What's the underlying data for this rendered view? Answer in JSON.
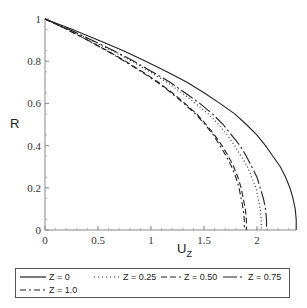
{
  "chart_data": {
    "type": "line",
    "title": "",
    "xlabel": "U",
    "xlabel_sub": "Z",
    "ylabel": "R",
    "xlim": [
      0,
      2.4
    ],
    "ylim": [
      0,
      1
    ],
    "xticks": [
      0,
      0.5,
      1,
      1.5,
      2
    ],
    "xtick_labels": [
      "0",
      "0.5",
      "1",
      "1.5",
      "2"
    ],
    "yticks": [
      0,
      0.2,
      0.4,
      0.6,
      0.8,
      1
    ],
    "ytick_labels": [
      "0",
      "0.2",
      "0.4",
      "0.6",
      "0.8",
      "1"
    ],
    "grid": false,
    "legend_position": "bottom",
    "R": [
      1.0,
      0.95,
      0.9,
      0.85,
      0.8,
      0.75,
      0.7,
      0.65,
      0.6,
      0.55,
      0.5,
      0.45,
      0.4,
      0.35,
      0.3,
      0.25,
      0.2,
      0.15,
      0.1,
      0.05,
      0.0
    ],
    "series": [
      {
        "name": "Z = 0",
        "style": "solid",
        "Umax": 2.37,
        "U": [
          0.0,
          0.26,
          0.5,
          0.74,
          0.95,
          1.15,
          1.34,
          1.5,
          1.65,
          1.79,
          1.9,
          2.0,
          2.08,
          2.15,
          2.22,
          2.27,
          2.31,
          2.34,
          2.36,
          2.37,
          2.37
        ]
      },
      {
        "name": "Z = 0.25",
        "style": "dotted",
        "Umax": 2.04,
        "U": [
          0.0,
          0.23,
          0.43,
          0.63,
          0.82,
          0.99,
          1.15,
          1.29,
          1.42,
          1.54,
          1.64,
          1.72,
          1.79,
          1.85,
          1.91,
          1.95,
          1.99,
          2.01,
          2.03,
          2.04,
          2.04
        ]
      },
      {
        "name": "Z = 0.50",
        "style": "dashed",
        "Umax": 1.9,
        "U": [
          0.0,
          0.21,
          0.4,
          0.59,
          0.76,
          0.92,
          1.07,
          1.2,
          1.32,
          1.43,
          1.52,
          1.6,
          1.67,
          1.73,
          1.78,
          1.82,
          1.85,
          1.87,
          1.89,
          1.9,
          1.9
        ]
      },
      {
        "name": "Z = 0.75",
        "style": "long-dash-dot",
        "Umax": 2.09,
        "U": [
          0.0,
          0.23,
          0.44,
          0.65,
          0.84,
          1.01,
          1.18,
          1.32,
          1.46,
          1.58,
          1.68,
          1.76,
          1.84,
          1.9,
          1.95,
          2.0,
          2.03,
          2.06,
          2.08,
          2.09,
          2.09
        ]
      },
      {
        "name": "Z = 1.0",
        "style": "dash-dot",
        "Umax": 1.88,
        "U": [
          0.0,
          0.21,
          0.4,
          0.58,
          0.75,
          0.91,
          1.06,
          1.19,
          1.31,
          1.42,
          1.51,
          1.59,
          1.65,
          1.71,
          1.76,
          1.8,
          1.83,
          1.85,
          1.87,
          1.88,
          1.88
        ]
      }
    ]
  },
  "legend": {
    "items": [
      {
        "label": "Z = 0",
        "style": "solid"
      },
      {
        "label": "Z = 0.25",
        "style": "dotted"
      },
      {
        "label": "Z = 0.50",
        "style": "dashed"
      },
      {
        "label": "Z = 0.75",
        "style": "long-dash-dot"
      },
      {
        "label": "Z = 1.0",
        "style": "dash-dot"
      }
    ]
  }
}
